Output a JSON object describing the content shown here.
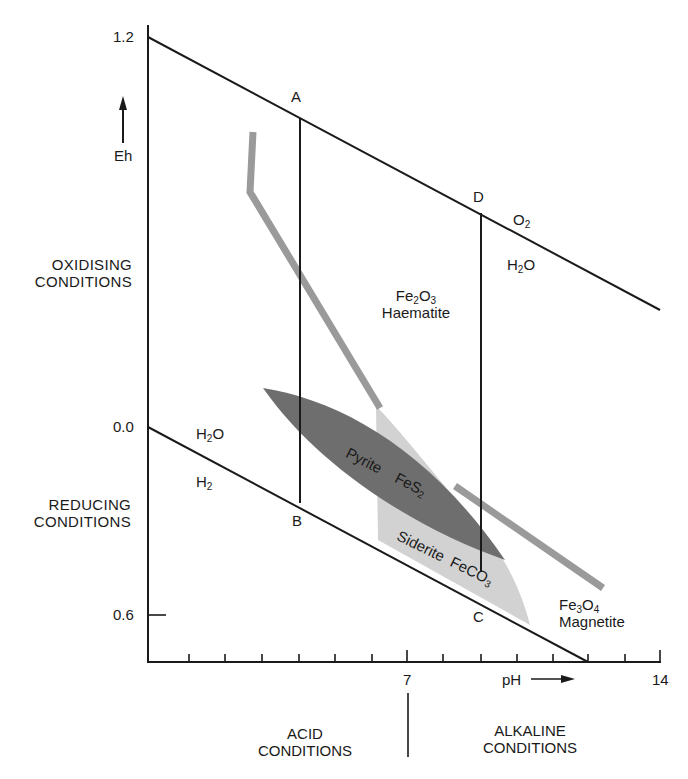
{
  "diagram": {
    "y_axis": {
      "label": "Eh",
      "arrow": "up-arrow",
      "ticks": [
        {
          "value": "1.2",
          "y": 37
        },
        {
          "value": "0.0",
          "y": 427
        },
        {
          "value": "0.6",
          "y": 615
        }
      ],
      "upper_region_label": [
        "OXIDISING",
        "CONDITIONS"
      ],
      "lower_region_label": [
        "REDUCING",
        "CONDITIONS"
      ]
    },
    "x_axis": {
      "label": "pH",
      "arrow": "right-arrow",
      "tick_labels": [
        {
          "value": "7",
          "x": 408
        },
        {
          "value": "14",
          "x": 660
        }
      ],
      "left_region_label": [
        "ACID",
        "CONDITIONS"
      ],
      "right_region_label": [
        "ALKALINE",
        "CONDITIONS"
      ]
    },
    "boundaries": {
      "upper": {
        "above": "O",
        "above_sub": "2",
        "below": "H",
        "below_sub": "2",
        "below_tail": "O"
      },
      "lower": {
        "above": "H",
        "above_sub": "2",
        "above_tail": "O",
        "below": "H",
        "below_sub": "2"
      }
    },
    "points": {
      "A": "A",
      "B": "B",
      "C": "C",
      "D": "D"
    },
    "minerals": {
      "haematite": {
        "formula_a": "Fe",
        "sub_a": "2",
        "formula_b": "O",
        "sub_b": "3",
        "name": "Haematite"
      },
      "pyrite": {
        "name": "Pyrite",
        "formula": "FeS",
        "sub": "2"
      },
      "siderite": {
        "name": "Siderite",
        "formula": "FeCO",
        "sub": "3"
      },
      "magnetite": {
        "formula_a": "Fe",
        "sub_a": "3",
        "formula_b": "O",
        "sub_b": "4",
        "name": "Magnetite"
      }
    },
    "colors": {
      "line": "#1a1a1a",
      "pyrite_fill": "#6e6e6e",
      "siderite_fill": "#d2d2d2",
      "boundary_band": "#9a9a9a"
    }
  }
}
